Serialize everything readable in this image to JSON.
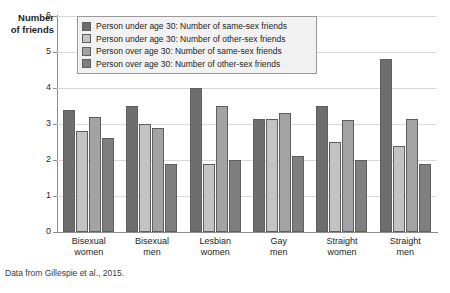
{
  "chart_data": {
    "type": "bar",
    "title": "",
    "xlabel": "",
    "ylabel": "Number of friends",
    "ylim": [
      0,
      6
    ],
    "yticks": [
      "0",
      "1",
      "2",
      "3",
      "4",
      "5",
      "6"
    ],
    "grid": true,
    "legend_position": "top-left-inside",
    "categories": [
      "Bisexual women",
      "Bisexual men",
      "Lesbian women",
      "Gay men",
      "Straight women",
      "Straight men"
    ],
    "category_lines": [
      [
        "Bisexual",
        "women"
      ],
      [
        "Bisexual",
        "men"
      ],
      [
        "Lesbian",
        "women"
      ],
      [
        "Gay",
        "men"
      ],
      [
        "Straight",
        "women"
      ],
      [
        "Straight",
        "men"
      ]
    ],
    "series": [
      {
        "name": "Person under age 30: Number of same-sex friends",
        "color": "#6e6e6e",
        "values": [
          3.4,
          3.5,
          4.0,
          3.15,
          3.5,
          4.8
        ]
      },
      {
        "name": "Person under age 30: Number of other-sex friends",
        "color": "#c3c3c3",
        "values": [
          2.8,
          3.0,
          1.9,
          3.15,
          2.5,
          2.4
        ]
      },
      {
        "name": "Person over age 30: Number of same-sex friends",
        "color": "#a3a3a3",
        "values": [
          3.2,
          2.9,
          3.5,
          3.3,
          3.1,
          3.15
        ]
      },
      {
        "name": "Person over age 30: Number of other-sex friends",
        "color": "#7f7f7f",
        "values": [
          2.6,
          1.9,
          2.0,
          2.1,
          2.0,
          1.9
        ]
      }
    ]
  },
  "axis": {
    "y_title_line1": "Number",
    "y_title_line2": "of friends"
  },
  "source": {
    "text": "Data from Gillespie et al., 2015."
  }
}
